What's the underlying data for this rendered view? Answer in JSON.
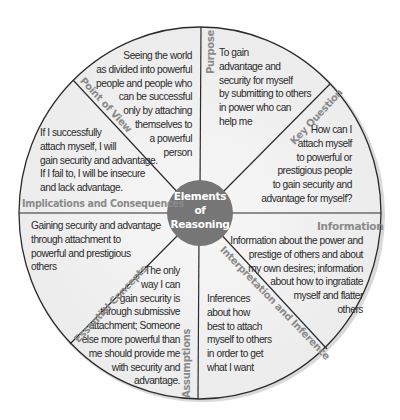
{
  "hub": {
    "line1": "Elements",
    "line2": "of",
    "line3": "Reasoning",
    "color": "#7a7a7a"
  },
  "colors": {
    "segment_fill": "#f1f1f1",
    "divider": "#2b2b2b",
    "label": "#8a8a8a",
    "text": "#2a2a2a"
  },
  "segments": {
    "point_of_view": {
      "label": "Point of View",
      "text": "Seeing the world\nas divided into powerful\npeople and people who\ncan be successful\nonly by attaching\nthemselves to\na powerful\nperson"
    },
    "purpose": {
      "label": "Purpose",
      "text": "To gain\nadvantage and\nsecurity for myself\nby submitting to others\nin power who can\nhelp me"
    },
    "key_question": {
      "label": "Key Question",
      "text": "How can I\nattach myself\nto powerful or\nprestigious people\nto gain security and\nadvantage for myself?"
    },
    "information": {
      "label": "Information",
      "text": "Information about the power and\nprestige of others and about\nmy own desires; information\nabout how to ingratiate\nmyself and flatter\nothers"
    },
    "interpretation": {
      "label": "Interpretation and Inference",
      "text": "Inferences\nabout how\nbest to attach\nmyself to others\nin order to get\nwhat I want"
    },
    "assumptions": {
      "label": "Assumptions",
      "text": "The only\nway I can\ngain security is\nthrough submissive\nattachment; Someone\nelse more powerful than\nme should provide me\nwith security and\nadvantage."
    },
    "essential_concepts": {
      "label": "Essential Concepts",
      "text": "Gaining security and advantage\nthrough attachment to\npowerful and prestigious\nothers"
    },
    "implications": {
      "label": "Implications and Consequences",
      "text": "If I successfully\nattach myself, I will\ngain security and advantage.\nIf I fail to, I will be insecure\nand lack advantage."
    }
  }
}
